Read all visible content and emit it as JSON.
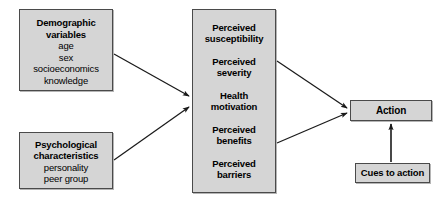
{
  "diagram": {
    "background_color": "#ffffff",
    "box_fill_color": "#d5d5d5",
    "box_border_color": "#4a4a4a",
    "arrow_color": "#1a1a1a",
    "nodes": {
      "demographic": {
        "header": "Demographic\nvariables",
        "sub": "age\nsex\nsocioeconomics\nknowledge"
      },
      "psychological": {
        "header": "Psychological\ncharacteristics",
        "sub": "personality\npeer group"
      },
      "beliefs": {
        "items": [
          "Perceived\nsusceptibility",
          "Perceived\nseverity",
          "Health\nmotivation",
          "Perceived\nbenefits",
          "Perceived\nbarriers"
        ]
      },
      "action": {
        "header": "Action"
      },
      "cues": {
        "header": "Cues to action"
      }
    },
    "arrows": [
      {
        "name": "demographic-to-beliefs",
        "from": "demographic",
        "to": "beliefs"
      },
      {
        "name": "psychological-to-beliefs",
        "from": "psychological",
        "to": "beliefs"
      },
      {
        "name": "beliefs-to-action-upper",
        "from": "beliefs",
        "to": "action"
      },
      {
        "name": "beliefs-to-action-lower",
        "from": "beliefs",
        "to": "action"
      },
      {
        "name": "cues-to-action",
        "from": "cues",
        "to": "action"
      }
    ]
  }
}
